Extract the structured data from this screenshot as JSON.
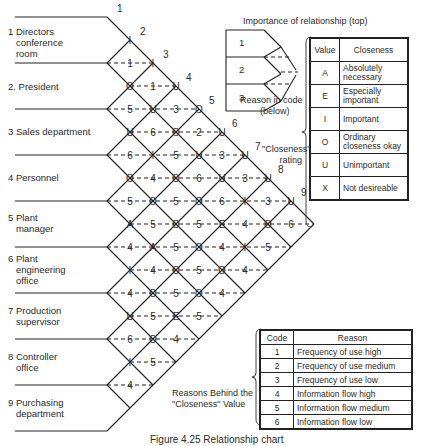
{
  "departments": [
    {
      "label": "1 Directors\n   conference\n   room",
      "top": 26
    },
    {
      "label": "2. President",
      "top": 81
    },
    {
      "label": "3 Sales department",
      "top": 126
    },
    {
      "label": "4 Personnel",
      "top": 172
    },
    {
      "label": "5 Plant\n   manager",
      "top": 212
    },
    {
      "label": "6 Plant\n   engineering\n   office",
      "top": 253
    },
    {
      "label": "7 Production\n   supervisor",
      "top": 305
    },
    {
      "label": "8 Controller\n   office",
      "top": 351
    },
    {
      "label": "9 Purchasing\n   department",
      "top": 397
    }
  ],
  "edge_numbers": [
    "1",
    "2",
    "3",
    "4",
    "5",
    "6",
    "7",
    "8",
    "9"
  ],
  "grid_rows": [
    [
      "I"
    ],
    [
      "1",
      "I"
    ],
    [
      "O",
      "1",
      "U"
    ],
    [
      "5",
      "U",
      "3",
      "O"
    ],
    [
      "U",
      "6",
      "O",
      "2",
      "U"
    ],
    [
      "6",
      "I",
      "5",
      "U",
      "3",
      "U"
    ],
    [
      "O",
      "4",
      "O",
      "6",
      "U",
      "3",
      "U"
    ],
    [
      "5",
      "O",
      "5",
      "O",
      "6",
      "I",
      "3",
      "U"
    ],
    [
      "A",
      "5",
      "O",
      "5",
      "E",
      "4",
      "O",
      "6"
    ],
    [
      "4",
      "A",
      "5",
      "O",
      "4",
      "I",
      "5"
    ],
    [
      "I",
      "4",
      "O",
      "5",
      "O",
      "4"
    ],
    [
      "4",
      "O",
      "5",
      "O",
      "4"
    ],
    [
      "U",
      "5",
      "E",
      "5"
    ],
    [
      "6",
      "O",
      "4"
    ],
    [
      "I",
      "5"
    ],
    [
      "4"
    ]
  ],
  "legend": {
    "importance_label": "Importance of relationship (top)",
    "reason_label": "Reason in code\n        (below)",
    "closeness_rating_label": "\"Closeness\"\n       rating",
    "example_rows": [
      "1",
      "2",
      "3"
    ]
  },
  "closeness_table": {
    "headers": [
      "Value",
      "Closeness"
    ],
    "rows": [
      {
        "value": "A",
        "closeness": "Absolutely necessary"
      },
      {
        "value": "E",
        "closeness": "Especially important"
      },
      {
        "value": "I",
        "closeness": "Important"
      },
      {
        "value": "O",
        "closeness": "Ordinary closeness okay"
      },
      {
        "value": "U",
        "closeness": "Unimportant"
      },
      {
        "value": "X",
        "closeness": "Not desireable"
      }
    ]
  },
  "reasons_label": "Reasons Behind the\n\"Closeness\" Value",
  "reason_table": {
    "headers": [
      "Code",
      "Reason"
    ],
    "rows": [
      {
        "code": "1",
        "reason": "Frequency of use high"
      },
      {
        "code": "2",
        "reason": "Frequency of use medium"
      },
      {
        "code": "3",
        "reason": "Frequency of use low"
      },
      {
        "code": "4",
        "reason": "Information flow high"
      },
      {
        "code": "5",
        "reason": "Information flow medium"
      },
      {
        "code": "6",
        "reason": "Information flow low"
      }
    ]
  },
  "caption": "Figure 4.25  Relationship chart"
}
